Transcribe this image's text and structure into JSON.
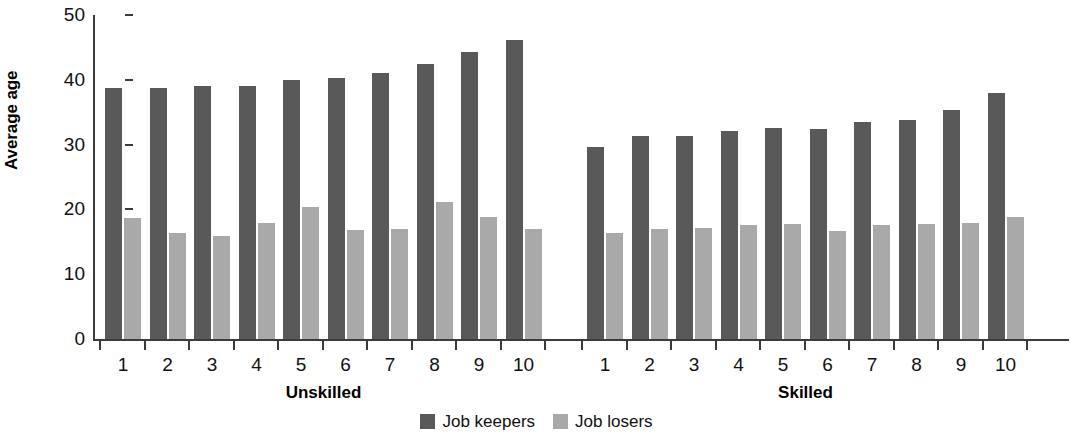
{
  "chart_data": {
    "type": "bar",
    "title": "",
    "xlabel": "",
    "ylabel": "Average age",
    "ylim": [
      0,
      50
    ],
    "yticks": [
      0,
      10,
      20,
      30,
      40,
      50
    ],
    "grid": false,
    "legend_position": "bottom-center",
    "groups": [
      {
        "name": "Unskilled",
        "categories": [
          "1",
          "2",
          "3",
          "4",
          "5",
          "6",
          "7",
          "8",
          "9",
          "10"
        ]
      },
      {
        "name": "Skilled",
        "categories": [
          "1",
          "2",
          "3",
          "4",
          "5",
          "6",
          "7",
          "8",
          "9",
          "10"
        ]
      }
    ],
    "series": [
      {
        "name": "Job keepers",
        "color": "#595959",
        "values_by_group": {
          "Unskilled": [
            38.7,
            38.8,
            39.0,
            39.0,
            40.0,
            40.3,
            41.0,
            42.4,
            44.3,
            46.2
          ],
          "Skilled": [
            29.6,
            31.4,
            31.3,
            32.1,
            32.6,
            32.4,
            33.5,
            33.8,
            35.3,
            38.0
          ]
        }
      },
      {
        "name": "Job losers",
        "color": "#a9a9a9",
        "values_by_group": {
          "Unskilled": [
            18.6,
            16.4,
            15.9,
            17.9,
            20.3,
            16.9,
            17.0,
            21.2,
            18.8,
            17.0
          ],
          "Skilled": [
            16.3,
            17.0,
            17.2,
            17.6,
            17.7,
            16.7,
            17.6,
            17.7,
            17.9,
            18.9
          ]
        }
      }
    ]
  },
  "axis": {
    "y_title": "Average age",
    "y_tick_labels": [
      "50",
      "40",
      "30",
      "20",
      "10",
      "0"
    ]
  },
  "legend": {
    "items": [
      {
        "label": "Job keepers",
        "color": "#595959"
      },
      {
        "label": "Job losers",
        "color": "#a9a9a9"
      }
    ]
  }
}
